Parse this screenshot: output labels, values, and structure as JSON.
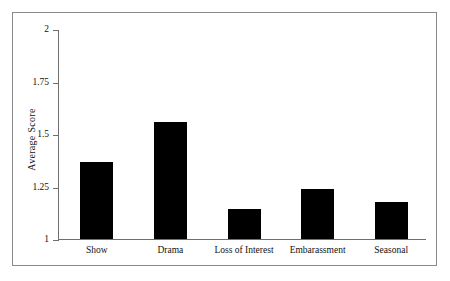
{
  "chart_data": {
    "type": "bar",
    "title": "",
    "xlabel": "",
    "ylabel": "Average Score",
    "categories": [
      "Show",
      "Drama",
      "Loss of Interest",
      "Embarassment",
      "Seasonal"
    ],
    "values": [
      1.37,
      1.56,
      1.15,
      1.245,
      1.18
    ],
    "ylim": [
      1,
      2
    ],
    "yticks": [
      1,
      1.25,
      1.5,
      1.75,
      2
    ],
    "ytick_labels": [
      "1",
      "1.25",
      "1.5",
      "1.75",
      "2"
    ],
    "grid": false,
    "legend": false,
    "bar_color": "#000000",
    "axis_color": "#6f6f6f",
    "frame_color": "#8a8a8a",
    "background": "#ffffff"
  }
}
